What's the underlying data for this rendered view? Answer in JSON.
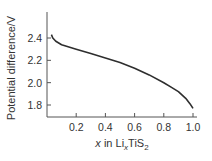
{
  "chart_data": {
    "type": "line",
    "title": "",
    "xlabel": "x in LixTiS2",
    "xlabel_parts": {
      "var": "x",
      "in": " in Li",
      "sub_x": "x",
      "mid": "TiS",
      "sub_2": "2"
    },
    "ylabel": "Potential difference/V",
    "xlim": [
      0,
      1.0
    ],
    "ylim": [
      1.72,
      2.55
    ],
    "xticks": [
      0.2,
      0.4,
      0.6,
      0.8,
      1.0
    ],
    "xtick_labels": [
      "0.2",
      "0.4",
      "0.6",
      "0.8",
      "1.0"
    ],
    "yticks": [
      1.8,
      2.0,
      2.2,
      2.4
    ],
    "ytick_labels": [
      "1.8",
      "2.0",
      "2.2",
      "2.4"
    ],
    "grid": false,
    "legend": null,
    "series": [
      {
        "name": "LixTiS2 discharge",
        "x": [
          0.03,
          0.04,
          0.06,
          0.1,
          0.2,
          0.3,
          0.4,
          0.5,
          0.6,
          0.7,
          0.8,
          0.85,
          0.9,
          0.95,
          0.98,
          1.0
        ],
        "y": [
          2.43,
          2.4,
          2.37,
          2.34,
          2.3,
          2.26,
          2.22,
          2.18,
          2.13,
          2.07,
          2.0,
          1.96,
          1.92,
          1.86,
          1.81,
          1.77
        ]
      }
    ],
    "color": "#2e2e2e"
  }
}
